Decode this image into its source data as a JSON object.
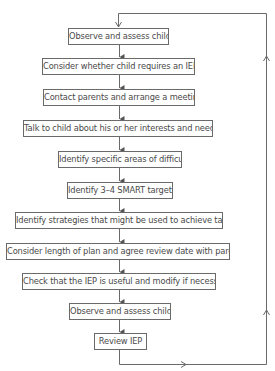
{
  "diagram": {
    "type": "flowchart",
    "direction": "top-to-bottom",
    "loop": "From 'Review IEP' back to first 'Observe and assess child' via right-side return line",
    "colors": {
      "line": "#6a6a6a",
      "text": "#4a4a4a",
      "background": "#ffffff"
    },
    "steps": [
      {
        "id": 1,
        "label": "Observe and assess child",
        "x": 68,
        "y": 28,
        "w": 101
      },
      {
        "id": 2,
        "label": "Consider whether child requires an IEP",
        "x": 42,
        "y": 58,
        "w": 153
      },
      {
        "id": 3,
        "label": "Contact parents and arrange a meeting",
        "x": 43,
        "y": 89,
        "w": 152
      },
      {
        "id": 4,
        "label": "Talk to child about his or her interests and needs",
        "x": 23,
        "y": 120,
        "w": 190
      },
      {
        "id": 5,
        "label": "Identify specific areas of difficulty",
        "x": 58,
        "y": 151,
        "w": 124
      },
      {
        "id": 6,
        "label": "Identify 3–4 SMART targets",
        "x": 67,
        "y": 182,
        "w": 106
      },
      {
        "id": 7,
        "label": "Identify strategies that might be used to achieve targets",
        "x": 15,
        "y": 212,
        "w": 208
      },
      {
        "id": 8,
        "label": "Consider length of plan and agree review date with parents",
        "x": 6,
        "y": 243,
        "w": 224
      },
      {
        "id": 9,
        "label": "Check that the IEP is useful and modify if necessary",
        "x": 22,
        "y": 273,
        "w": 194
      },
      {
        "id": 10,
        "label": "Observe and assess child",
        "x": 69,
        "y": 303,
        "w": 102
      },
      {
        "id": 11,
        "label": "Review IEP",
        "x": 94,
        "y": 333,
        "w": 53
      }
    ]
  }
}
